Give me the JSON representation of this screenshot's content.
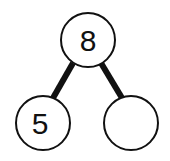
{
  "diagram": {
    "type": "number-bond",
    "whole": {
      "value": "8"
    },
    "parts": [
      {
        "value": "5"
      },
      {
        "value": ""
      }
    ],
    "colors": {
      "stroke": "#111111",
      "background": "#ffffff"
    }
  }
}
